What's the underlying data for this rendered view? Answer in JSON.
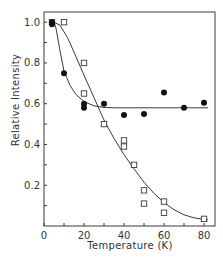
{
  "chart_data": {
    "type": "scatter",
    "title": "",
    "xlabel": "Temperature (K)",
    "ylabel": "Relative Intensity",
    "xlim": [
      0,
      85.5
    ],
    "ylim": [
      0,
      1.05
    ],
    "x_ticks": [
      0,
      20,
      40,
      60,
      80
    ],
    "x_minor_ticks": [
      10,
      30,
      50,
      70
    ],
    "y_ticks": [
      0.2,
      0.4,
      0.6,
      0.8,
      1.0
    ],
    "y_tick_labels": [
      "0.2",
      "0.4",
      "0.6",
      "0.8",
      "1.0"
    ],
    "y_minor_ticks": [
      0.1,
      0.3,
      0.5,
      0.7,
      0.9
    ],
    "grid": false,
    "legend": null,
    "series": [
      {
        "name": "open squares",
        "marker": "square-open",
        "points": [
          [
            4,
            1.0
          ],
          [
            10,
            1.0
          ],
          [
            20,
            0.8
          ],
          [
            20,
            0.65
          ],
          [
            30,
            0.5
          ],
          [
            40,
            0.42
          ],
          [
            40,
            0.39
          ],
          [
            45,
            0.3
          ],
          [
            50,
            0.175
          ],
          [
            50,
            0.11
          ],
          [
            60,
            0.12
          ],
          [
            60,
            0.065
          ],
          [
            80,
            0.035
          ]
        ],
        "fit_curve": [
          [
            5,
            1.0
          ],
          [
            8,
            0.985
          ],
          [
            12,
            0.92
          ],
          [
            16,
            0.83
          ],
          [
            20,
            0.74
          ],
          [
            25,
            0.63
          ],
          [
            30,
            0.52
          ],
          [
            35,
            0.43
          ],
          [
            40,
            0.35
          ],
          [
            45,
            0.28
          ],
          [
            50,
            0.215
          ],
          [
            55,
            0.16
          ],
          [
            60,
            0.115
          ],
          [
            65,
            0.08
          ],
          [
            70,
            0.055
          ],
          [
            75,
            0.04
          ],
          [
            80,
            0.032
          ],
          [
            82,
            0.03
          ]
        ]
      },
      {
        "name": "filled circles",
        "marker": "circle-filled",
        "points": [
          [
            4,
            1.0
          ],
          [
            4,
            0.99
          ],
          [
            10,
            0.75
          ],
          [
            20,
            0.6
          ],
          [
            20,
            0.58
          ],
          [
            30,
            0.6
          ],
          [
            40,
            0.545
          ],
          [
            50,
            0.55
          ],
          [
            60,
            0.655
          ],
          [
            70,
            0.58
          ],
          [
            80,
            0.605
          ]
        ],
        "fit_curve": [
          [
            5,
            1.0
          ],
          [
            6,
            0.97
          ],
          [
            8,
            0.86
          ],
          [
            10,
            0.76
          ],
          [
            13,
            0.69
          ],
          [
            16,
            0.645
          ],
          [
            20,
            0.61
          ],
          [
            25,
            0.59
          ],
          [
            30,
            0.582
          ],
          [
            35,
            0.58
          ],
          [
            82,
            0.58
          ]
        ]
      }
    ]
  }
}
